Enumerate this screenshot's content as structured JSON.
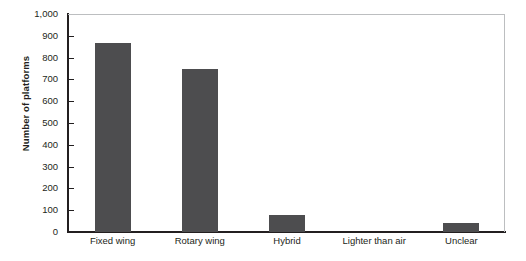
{
  "chart_data": {
    "type": "bar",
    "title": "",
    "xlabel": "",
    "ylabel": "Number of platforms",
    "categories": [
      "Fixed wing",
      "Rotary wing",
      "Hybrid",
      "Lighter than air",
      "Unclear"
    ],
    "values": [
      865,
      750,
      80,
      0,
      40
    ],
    "ylim": [
      0,
      1000
    ],
    "ytick_values": [
      0,
      100,
      200,
      300,
      400,
      500,
      600,
      700,
      800,
      900,
      1000
    ],
    "ytick_labels": [
      "0",
      "100",
      "200",
      "300",
      "400",
      "500",
      "600",
      "700",
      "800",
      "900",
      "1,000"
    ],
    "grid": false,
    "legend": null,
    "bar_color": "#4d4d4f",
    "axis_color": "#231f20",
    "frame_color": "#bcbec0",
    "background": "#ffffff"
  }
}
